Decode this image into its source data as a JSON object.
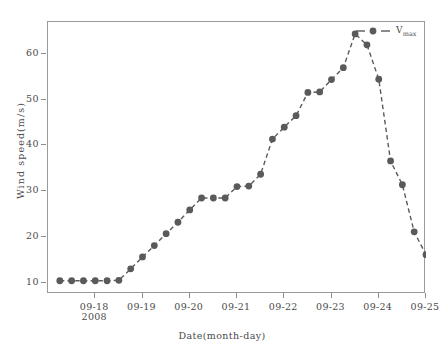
{
  "chart_data": {
    "type": "line",
    "title": "",
    "xlabel": "Date(month-day)",
    "ylabel": "Wind speed(m/s)",
    "xlim": [
      0,
      32
    ],
    "ylim": [
      7.5,
      67
    ],
    "grid": false,
    "legend_position": "top-right",
    "x_tick_labels": [
      "09-18",
      "09-19",
      "09-20",
      "09-21",
      "09-22",
      "09-23",
      "09-24",
      "09-25"
    ],
    "x_tick_positions": [
      4,
      8,
      12,
      16,
      20,
      24,
      28,
      32
    ],
    "x_axis_year_note": "2008",
    "y_tick_labels": [
      "10",
      "20",
      "30",
      "40",
      "50",
      "60"
    ],
    "y_tick_values": [
      10,
      20,
      30,
      40,
      50,
      60
    ],
    "series": [
      {
        "name": "Vmax",
        "legend_label_base": "V",
        "legend_label_sub": "max",
        "marker": "circle",
        "line_style": "dashed",
        "color": "#5a5a5a",
        "x": [
          1,
          2,
          3,
          4,
          5,
          6,
          7,
          8,
          9,
          10,
          11,
          12,
          13,
          14,
          15,
          16,
          17,
          18,
          19,
          20,
          21,
          22,
          23,
          24,
          25,
          26,
          27,
          28,
          29,
          30,
          31,
          32
        ],
        "values": [
          10.4,
          10.4,
          10.4,
          10.4,
          10.4,
          10.5,
          13.0,
          15.6,
          18.1,
          20.7,
          23.2,
          25.9,
          28.5,
          28.5,
          28.5,
          31.0,
          31.1,
          33.7,
          41.4,
          44.0,
          46.5,
          51.6,
          51.7,
          54.4,
          57.0,
          64.4,
          62.0,
          54.5,
          36.6,
          31.4,
          21.1,
          16.1
        ]
      }
    ],
    "extra_point": {
      "x": 33,
      "value": 11.0
    }
  },
  "figure": {
    "background_color": "#ffffff",
    "frame_color": "#9a9a9a",
    "text_color": "#4a4a4a"
  }
}
